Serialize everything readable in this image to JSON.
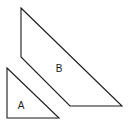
{
  "diagram": {
    "shapes": [
      {
        "id": "B",
        "type": "quadrilateral",
        "points": "21,8 122,106 70,106 21,57",
        "label": "B",
        "label_pos": {
          "x": 59,
          "y": 72
        }
      },
      {
        "id": "A",
        "type": "right-triangle",
        "points": "7,68 59,118 7,118",
        "label": "A",
        "label_pos": {
          "x": 21,
          "y": 109
        }
      }
    ],
    "stroke_color": "#1a1a1a",
    "background": "#ffffff"
  }
}
